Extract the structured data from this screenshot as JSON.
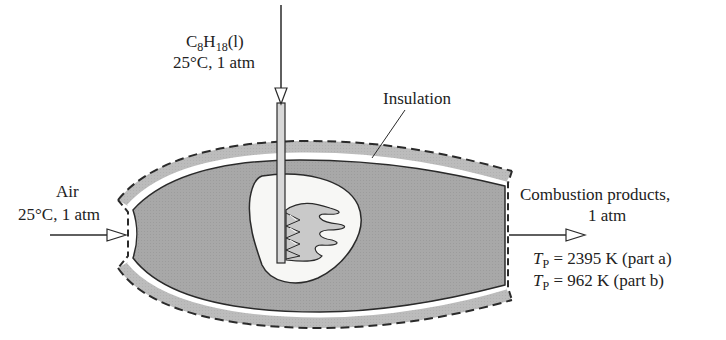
{
  "diagram": {
    "type": "combustion-chamber-schematic",
    "fuel_inlet": {
      "species_base": "C",
      "species_sub1": "8",
      "species_mid": "H",
      "species_sub2": "18",
      "phase": "(l)",
      "conditions": "25°C, 1 atm"
    },
    "air_inlet": {
      "label": "Air",
      "conditions": "25°C, 1 atm"
    },
    "insulation": {
      "label": "Insulation"
    },
    "products_outlet": {
      "label": "Combustion products,",
      "pressure": "1 atm",
      "temp_symbol": "T",
      "temp_subscript": "P",
      "part_a_value": " = 2395 K (part a)",
      "part_b_value": " = 962 K (part b)"
    },
    "colors": {
      "chamber_fill": "#a9a9a9",
      "insulation_fill": "#bdbdbd",
      "line": "#2a2a2a",
      "cavity_fill": "#f7f7f5",
      "flame_fill": "#c8c8c8"
    }
  }
}
